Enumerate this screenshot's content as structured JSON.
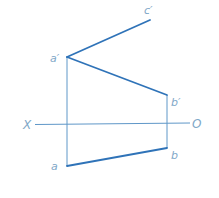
{
  "diagram": {
    "axis": {
      "left_label": "X",
      "right_label": "O"
    },
    "points": {
      "c_prime": "c′",
      "a_prime": "a′",
      "b_prime": "b′",
      "a": "a",
      "b": "b"
    },
    "colors": {
      "line": "#2f73b8",
      "thin_line": "#5f97c8",
      "label": "#7fa8c8"
    }
  }
}
